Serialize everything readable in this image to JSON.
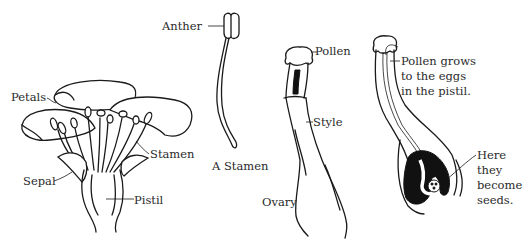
{
  "diagram": {
    "colors": {
      "ink": "#1a1a1a",
      "text": "#2a2a2a",
      "background": "#ffffff"
    },
    "flower": {
      "labels": {
        "petals": "Petals",
        "stamen": "Stamen",
        "sepal": "Sepal",
        "pistil": "Pistil"
      }
    },
    "single_stamen": {
      "caption": "A Stamen",
      "labels": {
        "anther": "Anther"
      }
    },
    "pistil_pollen": {
      "labels": {
        "pollen": "Pollen",
        "style": "Style",
        "ovary": "Ovary"
      }
    },
    "pistil_growth": {
      "labels": {
        "pollen_grows_line1": "Pollen grows",
        "pollen_grows_line2": "to the eggs",
        "pollen_grows_line3": "in the pistil.",
        "seeds_line1": "Here",
        "seeds_line2": "they",
        "seeds_line3": "become",
        "seeds_line4": "seeds."
      }
    }
  }
}
